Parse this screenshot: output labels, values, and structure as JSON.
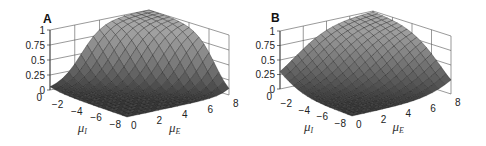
{
  "figure": {
    "panels": [
      {
        "label": "A",
        "zticks": [
          "0",
          "0.25",
          "0.5",
          "0.75",
          "1"
        ],
        "yticks": [
          "0",
          "−2",
          "−4",
          "−6",
          "−8"
        ],
        "xticks": [
          "0",
          "2",
          "4",
          "6",
          "8"
        ],
        "xlabel_main": "μ",
        "xlabel_sub": "E",
        "ylabel_main": "μ",
        "ylabel_sub": "I"
      },
      {
        "label": "B",
        "zticks": [
          "0",
          "0.25",
          "0.5",
          "0.75",
          "1"
        ],
        "yticks": [
          "0",
          "−2",
          "−4",
          "−6",
          "−8"
        ],
        "xticks": [
          "0",
          "2",
          "4",
          "6",
          "8"
        ],
        "xlabel_main": "μ",
        "xlabel_sub": "E",
        "ylabel_main": "μ",
        "ylabel_sub": "I"
      }
    ]
  },
  "chart_data": [
    {
      "type": "surface",
      "title": "A",
      "xlabel": "μ_E",
      "ylabel": "μ_I",
      "zlabel": "",
      "xlim": [
        0,
        8
      ],
      "ylim": [
        -8,
        0
      ],
      "zlim": [
        0,
        1
      ],
      "xticks": [
        0,
        2,
        4,
        6,
        8
      ],
      "yticks": [
        0,
        -2,
        -4,
        -6,
        -8
      ],
      "zticks": [
        0,
        0.25,
        0.5,
        0.75,
        1
      ],
      "description": "Smooth sigmoidal/Gaussian-like surface rising to peak ≈1 near μ_E=8, μ_I=0 corner (back), near 0 over most of the floor at low μ_E / very negative μ_I",
      "peak": {
        "mu_E": 8,
        "mu_I": 0,
        "z": 1.0
      },
      "grid": true
    },
    {
      "type": "surface",
      "title": "B",
      "xlabel": "μ_E",
      "ylabel": "μ_I",
      "zlabel": "",
      "xlim": [
        0,
        8
      ],
      "ylim": [
        -8,
        0
      ],
      "zlim": [
        0,
        1
      ],
      "xticks": [
        0,
        2,
        4,
        6,
        8
      ],
      "yticks": [
        0,
        -2,
        -4,
        -6,
        -8
      ],
      "zticks": [
        0,
        0.25,
        0.5,
        0.75,
        1
      ],
      "description": "Broader surface than A, rising more linearly toward peak ≈1 at μ_E=8, μ_I=0 corner with wider transition region",
      "peak": {
        "mu_E": 8,
        "mu_I": 0,
        "z": 1.0
      },
      "grid": true
    }
  ]
}
